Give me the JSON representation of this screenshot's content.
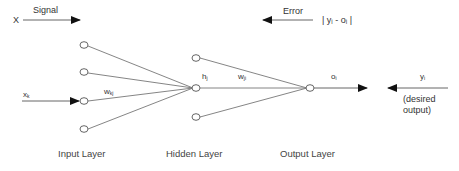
{
  "signal": {
    "label": "Signal",
    "input_var": "X"
  },
  "error": {
    "label": "Error",
    "formula": "| yᵢ - oᵢ |"
  },
  "labels": {
    "input_x": "x",
    "input_x_sub": "k",
    "weight_input_hidden": "w",
    "weight_input_hidden_sub": "kj",
    "hidden_h": "h",
    "hidden_h_sub": "j",
    "weight_hidden_output": "w",
    "weight_hidden_output_sub": "ji",
    "output_o": "o",
    "output_o_sub": "i",
    "desired_y": "y",
    "desired_y_sub": "i",
    "desired_caption_1": "(desired",
    "desired_caption_2": "output)"
  },
  "layers": {
    "input": "Input Layer",
    "hidden": "Hidden Layer",
    "output": "Output Layer"
  },
  "colors": {
    "line": "#666666",
    "arrow": "#111111",
    "node_fill": "#ffffff"
  }
}
